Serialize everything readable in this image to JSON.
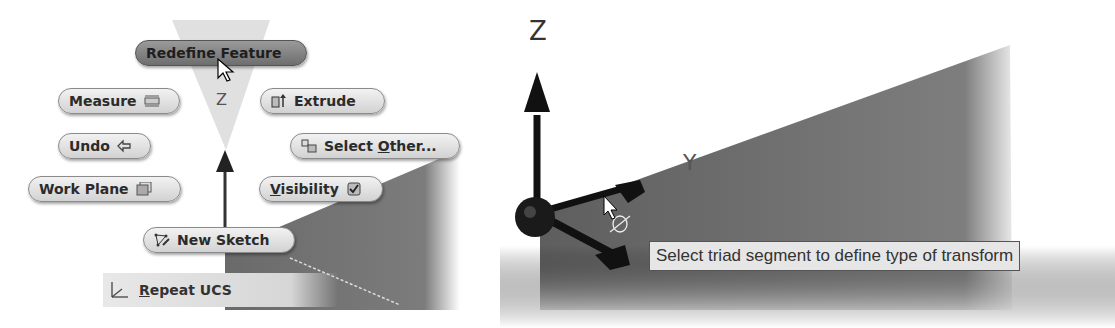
{
  "marking_menu": {
    "items": [
      {
        "id": "redefine-feature",
        "label": "Redefine Feature",
        "icon": "none",
        "active": true
      },
      {
        "id": "measure",
        "label": "Measure",
        "icon": "ruler-icon"
      },
      {
        "id": "extrude",
        "label": "Extrude",
        "icon": "extrude-icon"
      },
      {
        "id": "undo",
        "label": "Undo",
        "icon": "undo-arrow-icon"
      },
      {
        "id": "select-other",
        "label_pre": "Select ",
        "label_u": "O",
        "label_post": "ther...",
        "icon": "select-other-icon"
      },
      {
        "id": "work-plane",
        "label": "Work Plane",
        "icon": "work-plane-icon"
      },
      {
        "id": "visibility",
        "label_u": "V",
        "label_post": "isibility",
        "icon": "checkbox-icon"
      },
      {
        "id": "new-sketch",
        "label": "New Sketch",
        "icon": "sketch-icon"
      }
    ],
    "overflow_item": {
      "label_u": "R",
      "label_post": "epeat UCS",
      "icon": "ucs-icon"
    }
  },
  "viewport_right": {
    "axis_labels": {
      "z": "Z",
      "y": "Y",
      "x": "X"
    },
    "tooltip": "Select triad segment to define type of transform"
  },
  "colors": {
    "model_face": "#7a7a7a",
    "pill_bg": "#dcdcdc",
    "active_pill_bg": "#808080",
    "tooltip_bg": "#e6e6e6"
  }
}
